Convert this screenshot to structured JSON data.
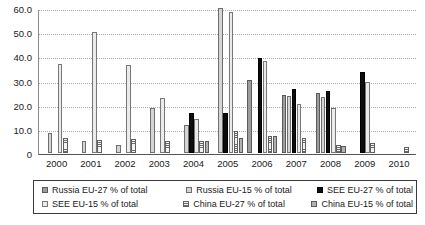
{
  "chart_data": {
    "type": "bar",
    "title": "",
    "subtitle": "",
    "xlabel": "",
    "ylabel": "",
    "ylim": [
      0,
      60
    ],
    "yticks": [
      "60.0",
      "50.0",
      "40.0",
      "30.0",
      "20.0",
      "10.0",
      "0"
    ],
    "ytick_values": [
      60,
      50,
      40,
      30,
      20,
      10,
      0
    ],
    "grid": true,
    "legend_position": "bottom",
    "categories": [
      "2000",
      "2001",
      "2002",
      "2003",
      "2004",
      "2005",
      "2006",
      "2007",
      "2008",
      "2009",
      "2010"
    ],
    "series": [
      {
        "name": "Russia EU-27 % of total",
        "color": "#9d9d9d",
        "pattern": "solid-gray",
        "values": [
          0,
          0,
          0,
          0,
          0,
          0,
          30.2,
          23.8,
          24.5,
          0,
          0
        ]
      },
      {
        "name": "Russia EU-15 % of total",
        "color": "#d5d5d5",
        "pattern": "light-gray",
        "values": [
          8.2,
          4.6,
          3.2,
          18.5,
          11.2,
          60.0,
          0,
          23.3,
          23.0,
          0,
          0
        ]
      },
      {
        "name": "SEE EU-27 % of total",
        "color": "#0d0d0d",
        "pattern": "black",
        "values": [
          0,
          0,
          0,
          0,
          16.2,
          16.4,
          39.0,
          26.2,
          25.6,
          33.4,
          0
        ]
      },
      {
        "name": "SEE EU-15 % of total",
        "color": "#ebebeb",
        "pattern": "very-light-gray",
        "values": [
          36.6,
          49.7,
          36.3,
          22.7,
          13.9,
          58.3,
          37.7,
          20.1,
          18.5,
          29.0,
          0
        ]
      },
      {
        "name": "China EU-27 % of total",
        "color": "#6b6b6b",
        "pattern": "horizontal-stripes",
        "values": [
          6.1,
          5.2,
          5.7,
          4.7,
          4.7,
          8.7,
          6.8,
          6.0,
          3.0,
          3.8,
          2.4
        ]
      },
      {
        "name": "China EU-15 % of total",
        "color": "#b2b2b2",
        "pattern": "medium-gray",
        "values": [
          0,
          0,
          0,
          0,
          4.7,
          6.2,
          6.9,
          0,
          2.9,
          0,
          0
        ]
      }
    ]
  }
}
